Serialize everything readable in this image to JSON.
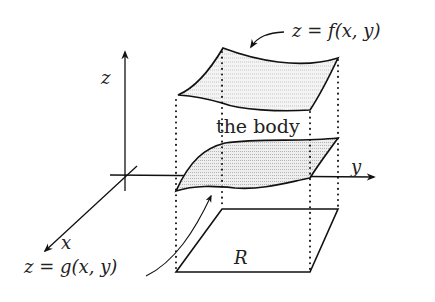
{
  "diagram": {
    "title": "",
    "labels": {
      "z_axis": "z",
      "y_axis": "y",
      "x_axis": "x",
      "top_surface": "z = f(x, y)",
      "bottom_surface": "z = g(x, y)",
      "body": "the body",
      "region": "R"
    },
    "elements": [
      {
        "id": "z-axis",
        "type": "axis",
        "label": "z"
      },
      {
        "id": "y-axis",
        "type": "axis",
        "label": "y"
      },
      {
        "id": "x-axis",
        "type": "axis",
        "label": "x"
      },
      {
        "id": "top-surface",
        "type": "shaded-surface",
        "label": "z = f(x, y)"
      },
      {
        "id": "bottom-surface",
        "type": "shaded-surface",
        "label": "z = g(x, y)"
      },
      {
        "id": "region-R",
        "type": "parallelogram",
        "label": "R"
      },
      {
        "id": "body",
        "type": "annotation",
        "label": "the body"
      }
    ],
    "colors": {
      "stroke": "#111111",
      "hatch": "#9a9a9a",
      "fill": "#f2f2f2",
      "background": "#ffffff"
    }
  }
}
